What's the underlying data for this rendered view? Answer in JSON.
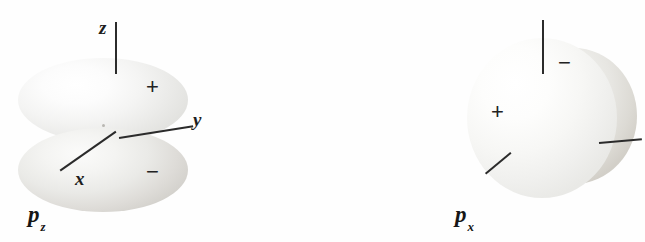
{
  "figure": {
    "background_color": "#fefefe",
    "line_color": "#2b2b2b",
    "text_color": "#1e1e1e",
    "width": 645,
    "height": 242
  },
  "panels": [
    {
      "id": "pz",
      "label_base": "p",
      "label_sub": "z",
      "axes": [
        {
          "name": "z",
          "label": "z",
          "orientation": "vertical-up"
        },
        {
          "name": "y",
          "label": "y",
          "orientation": "right-slight-up"
        },
        {
          "name": "x",
          "label": "x",
          "orientation": "lower-left-diagonal"
        }
      ],
      "signs": [
        {
          "symbol": "+",
          "lobe": "upper"
        },
        {
          "symbol": "−",
          "lobe": "lower"
        }
      ]
    },
    {
      "id": "px",
      "label_base": "p",
      "label_sub": "x",
      "axes": [
        {
          "name": "z",
          "label": "",
          "orientation": "vertical-up"
        },
        {
          "name": "y",
          "label": "",
          "orientation": "right-slight-up"
        },
        {
          "name": "x",
          "label": "",
          "orientation": "lower-left-diagonal"
        }
      ],
      "signs": [
        {
          "symbol": "+",
          "lobe": "front"
        },
        {
          "symbol": "−",
          "lobe": "back"
        }
      ]
    },
    {
      "id": "py",
      "label_base": "p",
      "label_sub": "y",
      "axes": [
        {
          "name": "z",
          "label": "",
          "orientation": "vertical-up"
        },
        {
          "name": "y",
          "label": "",
          "orientation": "right-horizontal"
        },
        {
          "name": "x",
          "label": "",
          "orientation": "lower-left-diagonal"
        }
      ],
      "signs": [
        {
          "symbol": "−",
          "lobe": "left"
        },
        {
          "symbol": "+",
          "lobe": "right"
        }
      ]
    }
  ],
  "labels": {
    "pz_axis_z": "z",
    "pz_axis_y": "y",
    "pz_axis_x": "x",
    "pz_plus": "+",
    "pz_minus": "−",
    "px_minus": "−",
    "px_plus": "+",
    "py_minus": "−",
    "py_plus": "+",
    "pz_name": "p",
    "pz_sub": "z",
    "px_name": "p",
    "px_sub": "x",
    "py_name": "p",
    "py_sub": "y"
  }
}
